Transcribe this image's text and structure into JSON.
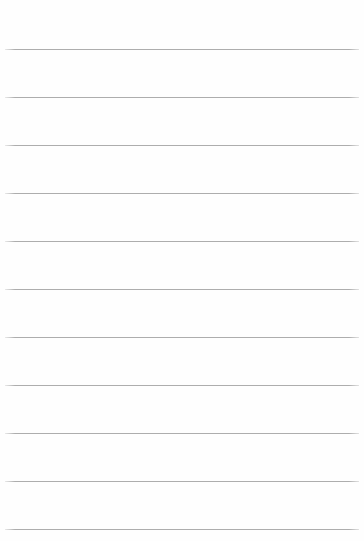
{
  "page": {
    "width": 364,
    "height": 541,
    "background_color": "#fefefe",
    "document_type": "ruled-paper",
    "title": ""
  },
  "ruled_lines": {
    "count": 11,
    "color": "#adadad",
    "thickness_px": 1,
    "left_x": 5,
    "right_x": 359,
    "spacing_px": 48,
    "first_line_y": 49,
    "y_positions": [
      49,
      97,
      145,
      193,
      241,
      289,
      337,
      385,
      433,
      481,
      529
    ]
  },
  "text_content": {
    "lines": [
      "",
      "",
      "",
      "",
      "",
      "",
      "",
      "",
      "",
      "",
      ""
    ]
  }
}
